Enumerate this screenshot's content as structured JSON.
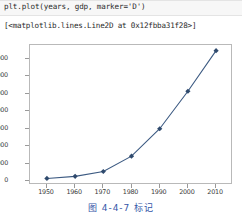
{
  "notebook": {
    "code_line": "plt.plot(years, gdp, marker='D')",
    "output_repr": "[<matplotlib.lines.Line2D at 0x12fbba31f28>]"
  },
  "caption": {
    "text": "图 4-4-7  标记"
  },
  "style": {
    "line_color": "#3c5a82",
    "marker_color": "#2f4a6d",
    "axes_color": "#b9b9b9",
    "tick_text_color": "#3a3a3a",
    "caption_color": "#3556a8",
    "cell_background": "#f7f7f7"
  },
  "chart_data": {
    "type": "line",
    "title": "",
    "xlabel": "",
    "ylabel": "",
    "marker": "D",
    "grid": false,
    "legend": false,
    "x": [
      1950,
      1960,
      1970,
      1980,
      1990,
      2000,
      2010
    ],
    "values": [
      300,
      540,
      1100,
      2860,
      6000,
      10300,
      14950
    ],
    "xticks": [
      "1950",
      "1960",
      "1970",
      "1980",
      "1990",
      "2000",
      "2010"
    ],
    "yticks": [
      "0",
      "2000",
      "4000",
      "6000",
      "8000",
      "10000",
      "12000",
      "14000"
    ],
    "ytick_values": [
      0,
      2000,
      4000,
      6000,
      8000,
      10000,
      12000,
      14000
    ],
    "xlim": [
      1944,
      2016
    ],
    "ylim": [
      -450,
      15600
    ]
  }
}
